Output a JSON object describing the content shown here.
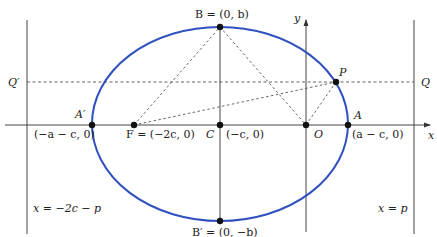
{
  "diagram": {
    "type": "ellipse-focus-directrix",
    "colors": {
      "ellipse": "#3050c0",
      "lines": "#444444",
      "dashed": "#555555",
      "points": "#111111"
    },
    "labels": {
      "B": "B = (0, b)",
      "B_prime": "B′ = (0, −b)",
      "A_prime": "A′",
      "A_prime_coord": "(−a − c, 0)",
      "A": "A",
      "A_coord": "(a − c, 0)",
      "F": "F = (−2c, 0)",
      "C": "C",
      "C_coord": "(−c, 0)",
      "O": "O",
      "P": "P",
      "Q": "Q",
      "Q_prime": "Q′",
      "x_axis": "x",
      "y_axis": "y",
      "left_directrix": "x = −2c − p",
      "right_directrix": "x = p"
    }
  }
}
